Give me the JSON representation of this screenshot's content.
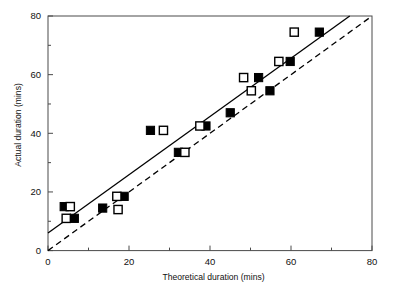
{
  "chart_data": {
    "type": "scatter",
    "title": "",
    "xlabel": "Theoretical duration (mins)",
    "ylabel": "Actual duration (mins)",
    "xlim": [
      0,
      80
    ],
    "ylim": [
      0,
      80
    ],
    "xticks": [
      0,
      20,
      40,
      60,
      80
    ],
    "yticks": [
      0,
      20,
      40,
      60,
      80
    ],
    "xticklabels": [
      "0",
      "20",
      "40",
      "60",
      "80"
    ],
    "yticklabels": [
      "0",
      "20",
      "40",
      "60",
      "80"
    ],
    "x_minor_ticks": [
      10,
      30,
      50,
      70
    ],
    "y_minor_ticks": [
      10,
      30,
      50,
      70
    ],
    "grid": false,
    "legend": "none",
    "series": [
      {
        "name": "filled-squares",
        "marker": "filled-square",
        "color": "#000000",
        "points": [
          {
            "x": 4.0,
            "y": 15.0
          },
          {
            "x": 6.5,
            "y": 11.0
          },
          {
            "x": 13.5,
            "y": 14.5
          },
          {
            "x": 18.8,
            "y": 18.5
          },
          {
            "x": 25.3,
            "y": 41.0
          },
          {
            "x": 32.2,
            "y": 33.5
          },
          {
            "x": 39.0,
            "y": 42.5
          },
          {
            "x": 45.0,
            "y": 47.0
          },
          {
            "x": 52.0,
            "y": 59.0
          },
          {
            "x": 54.8,
            "y": 54.5
          },
          {
            "x": 59.8,
            "y": 64.5
          },
          {
            "x": 67.0,
            "y": 74.5
          }
        ]
      },
      {
        "name": "open-squares",
        "marker": "open-square",
        "color": "#000000",
        "points": [
          {
            "x": 5.5,
            "y": 15.0
          },
          {
            "x": 4.5,
            "y": 11.0
          },
          {
            "x": 17.0,
            "y": 18.5
          },
          {
            "x": 17.3,
            "y": 14.0
          },
          {
            "x": 28.5,
            "y": 41.0
          },
          {
            "x": 33.8,
            "y": 33.5
          },
          {
            "x": 37.5,
            "y": 42.5
          },
          {
            "x": 48.3,
            "y": 59.0
          },
          {
            "x": 50.2,
            "y": 54.5
          },
          {
            "x": 57.0,
            "y": 64.5
          },
          {
            "x": 60.8,
            "y": 74.5
          }
        ]
      }
    ],
    "lines": [
      {
        "name": "regression-line",
        "style": "solid",
        "color": "#000000",
        "x0": 0,
        "y0": 6.0,
        "x1": 74.5,
        "y1": 80.0
      },
      {
        "name": "identity-line",
        "style": "dashed",
        "color": "#000000",
        "x0": 0,
        "y0": 0,
        "x1": 80,
        "y1": 80
      }
    ]
  }
}
